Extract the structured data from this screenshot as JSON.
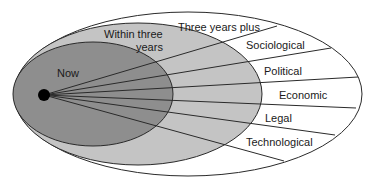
{
  "diagram": {
    "colors": {
      "outer_fill": "#ffffff",
      "middle_fill": "#c4c4c4",
      "inner_fill": "#8e8e8e",
      "stroke": "#2a2a2a",
      "dot": "#000000"
    },
    "zones": {
      "inner": {
        "label": "Now"
      },
      "middle": {
        "label_line1": "Within three",
        "label_line2": "years"
      },
      "outer": {
        "label": "Three years plus"
      }
    },
    "factors": [
      {
        "label": "Sociological"
      },
      {
        "label": "Political"
      },
      {
        "label": "Economic"
      },
      {
        "label": "Legal"
      },
      {
        "label": "Technological"
      }
    ]
  }
}
